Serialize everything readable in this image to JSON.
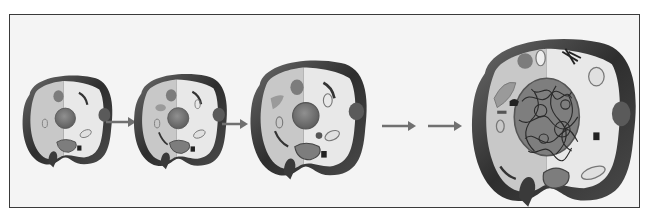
{
  "figure": {
    "title": "",
    "stages": [
      {
        "id": 1,
        "label": "",
        "size": "small"
      },
      {
        "id": 2,
        "label": "",
        "size": "small-medium"
      },
      {
        "id": 3,
        "label": "",
        "size": "medium"
      },
      {
        "id": 4,
        "label": "",
        "size": "large"
      }
    ],
    "arrows": 4,
    "colors": {
      "frame_border": "#3a3a3a",
      "background": "#f4f4f4",
      "cell_wall": "#3c3c3c",
      "cytoplasm_left": "#c9c9c9",
      "cytoplasm_right": "#e6e6e6",
      "nucleus": "#7a7a7a",
      "organelle": "#8c8c8c",
      "arrow": "#6a6a6a"
    }
  }
}
